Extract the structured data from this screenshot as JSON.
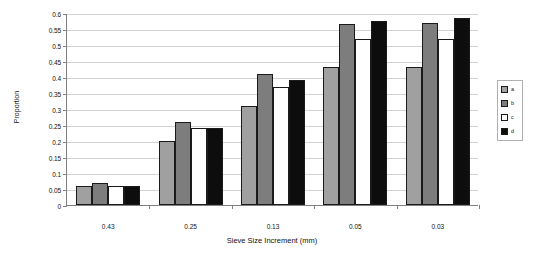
{
  "chart_data": {
    "type": "bar",
    "title": "",
    "xlabel": "Sieve Size Increment (mm)",
    "ylabel": "Proportion",
    "categories": [
      "0.43",
      "0.25",
      "0.13",
      "0.05",
      "0.03"
    ],
    "ylim": [
      0,
      0.6
    ],
    "yticks": [
      "0",
      "0.05",
      "0.1",
      "0.15",
      "0.2",
      "0.25",
      "0.3",
      "0.35",
      "0.4",
      "0.45",
      "0.5",
      "0.55",
      "0.6"
    ],
    "grid": true,
    "legend_position": "right",
    "series": [
      {
        "name": "a",
        "color": "#a0a0a0",
        "values": [
          0.06,
          0.2,
          0.31,
          0.43,
          0.43
        ]
      },
      {
        "name": "b",
        "color": "#7d7d7d",
        "values": [
          0.07,
          0.26,
          0.41,
          0.565,
          0.57
        ]
      },
      {
        "name": "c",
        "color": "#ffffff",
        "values": [
          0.06,
          0.24,
          0.37,
          0.52,
          0.52
        ]
      },
      {
        "name": "d",
        "color": "#0d0d0d",
        "values": [
          0.06,
          0.24,
          0.39,
          0.575,
          0.585
        ]
      }
    ]
  },
  "legend": {
    "items": [
      {
        "label": "a"
      },
      {
        "label": "b"
      },
      {
        "label": "c"
      },
      {
        "label": "d"
      }
    ]
  }
}
